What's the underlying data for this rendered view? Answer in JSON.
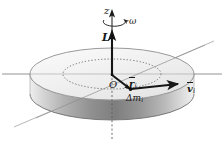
{
  "figure": {
    "width": 224,
    "height": 153
  },
  "labels": {
    "axis_z": "z",
    "angular_velocity": "ω",
    "angular_momentum": "L",
    "origin": "O",
    "radius_vector": "r",
    "radius_vector_sub": "i",
    "velocity_vector": "v",
    "velocity_vector_sub": "i",
    "mass_element": "Δm",
    "mass_element_sub": "i"
  },
  "colors": {
    "ink": "#1a1a1a",
    "disk_top": "#f2f2f2",
    "disk_top_edge": "#8c8c8c",
    "disk_side_light": "#e8e8e8",
    "disk_side_mid": "#b5b5b5",
    "disk_side_dark": "#7d7d7d",
    "axis_line": "#9a9a9a",
    "dotted_circle": "#6e6e6e",
    "background": "#ffffff"
  },
  "geometry": {
    "disk_center_x": 112,
    "disk_center_y": 74,
    "disk_rx": 82,
    "disk_ry": 26,
    "disk_thickness": 20,
    "inner_circle_rx": 49,
    "inner_circle_ry": 15,
    "mass_element_x": 130,
    "mass_element_y": 89,
    "velocity_tip_x": 185,
    "velocity_tip_y": 85,
    "L_arrow_tip_y": 30,
    "z_axis_top_y": 12
  }
}
